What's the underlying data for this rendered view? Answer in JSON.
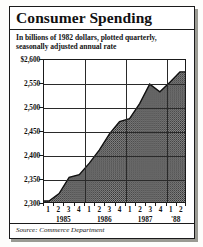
{
  "title": "Consumer Spending",
  "subtitle_line1": "In billions of 1982 dollars, plotted quarterly,",
  "subtitle_line2": "seasonally adjusted annual rate",
  "source": "Source: Commerce Department",
  "colors": {
    "ink": "#1a1a1a",
    "fill": "#6e6e6e",
    "background": "#ffffff"
  },
  "chart_data": {
    "type": "area",
    "title": "Consumer Spending",
    "subtitle": "In billions of 1982 dollars, plotted quarterly, seasonally adjusted annual rate",
    "xlabel": "",
    "ylabel": "",
    "ylim": [
      2300,
      2600
    ],
    "ytick_labels": [
      "$2,600",
      "2,550",
      "2,500",
      "2,450",
      "2,400",
      "2,350",
      "2,300"
    ],
    "yticks": [
      2600,
      2550,
      2500,
      2450,
      2400,
      2350,
      2300
    ],
    "grid": true,
    "legend": "none",
    "quarter_labels": [
      "1",
      "2",
      "3",
      "4",
      "1",
      "2",
      "3",
      "4",
      "1",
      "2",
      "3",
      "4",
      "1",
      "2"
    ],
    "year_labels": [
      "1985",
      "1986",
      "1987",
      "'88"
    ],
    "x": [
      "1985 Q1",
      "1985 Q2",
      "1985 Q3",
      "1985 Q4",
      "1986 Q1",
      "1986 Q2",
      "1986 Q3",
      "1986 Q4",
      "1987 Q1",
      "1987 Q2",
      "1987 Q3",
      "1987 Q4",
      "1988 Q1",
      "1988 Q2"
    ],
    "values": [
      2302,
      2318,
      2352,
      2358,
      2382,
      2410,
      2444,
      2470,
      2476,
      2508,
      2549,
      2533,
      2553,
      2575
    ],
    "units": "billions of 1982 dollars",
    "source": "Source: Commerce Department"
  }
}
